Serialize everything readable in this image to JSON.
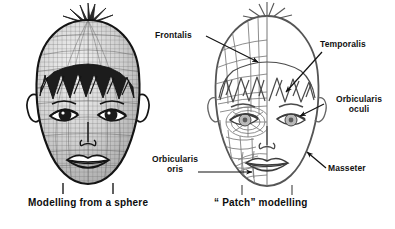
{
  "figure": {
    "type": "anatomical-diagram",
    "background_color": "#ffffff",
    "line_color": "#1a1a1a",
    "mesh_color": "#777777",
    "text_color": "#111111"
  },
  "left_figure": {
    "name": "sphere-modelled-head",
    "caption": "Modelling from a sphere",
    "mesh_style": "uniform fine quad grid wrapped over a sphere",
    "shading": "grey shaded"
  },
  "right_figure": {
    "name": "patch-modelled-head",
    "caption": "“ Patch” modelling",
    "mesh_style": "coarse irregular patches following muscle flow on left half",
    "shading": "light line art"
  },
  "labels": [
    {
      "id": "frontalis",
      "text": "Frontalis",
      "lines": [
        "Frontalis"
      ],
      "leader": "line sloping down-right to forehead patches"
    },
    {
      "id": "temporalis",
      "text": "Temporalis",
      "lines": [
        "Temporalis"
      ],
      "leader": "arrow pointing down-left to temple"
    },
    {
      "id": "orbicularis-oculi",
      "text": "Orbicularis oculi",
      "lines": [
        "Orbicularis",
        "oculi"
      ],
      "leader": "arrow pointing down-left to eye ring"
    },
    {
      "id": "orbicularis-oris",
      "text": "Orbicularis oris",
      "lines": [
        "Orbicularis",
        "oris"
      ],
      "leader": "horizontal line with arrow pointing right to mouth ring"
    },
    {
      "id": "masseter",
      "text": "Masseter",
      "lines": [
        "Masseter"
      ],
      "leader": "arrow pointing up-left to jaw"
    }
  ],
  "captions": {
    "left": "Modelling from a sphere",
    "right": "“ Patch” modelling"
  }
}
